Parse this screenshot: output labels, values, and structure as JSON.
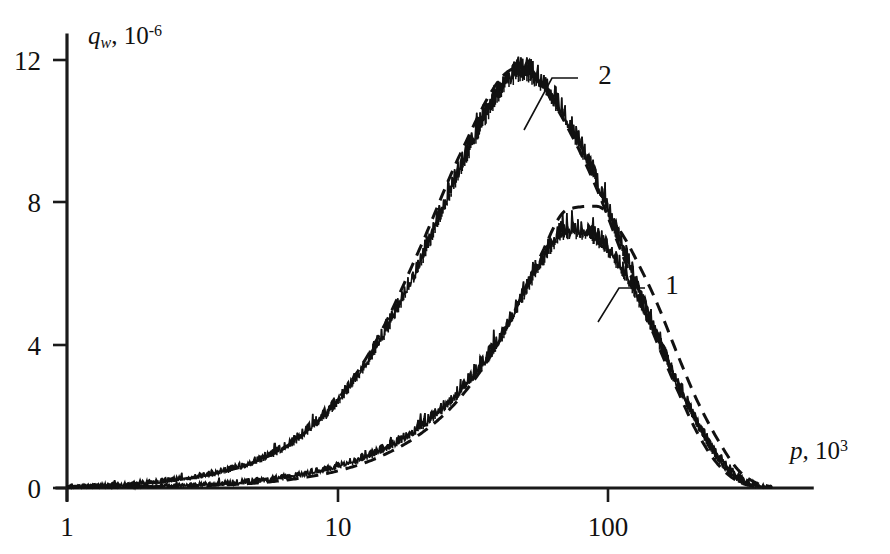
{
  "chart_data": {
    "type": "line",
    "title": "",
    "xlabel": "p, 10^3",
    "xlabel_base": "p,",
    "xlabel_mantissa": "10",
    "xlabel_exp": "3",
    "ylabel": "q_w, 10^-6",
    "ylabel_sym": "q",
    "ylabel_sub": "w",
    "ylabel_comma": ",",
    "ylabel_mantissa": "10",
    "ylabel_exp": "-6",
    "xscale": "log",
    "yscale": "linear",
    "xlim": [
      1,
      400
    ],
    "ylim": [
      0,
      13.2
    ],
    "grid": false,
    "legend_position": "inline-annotations",
    "x_ticks": [
      {
        "value": 1,
        "label": "1",
        "px": 67
      },
      {
        "value": 10,
        "label": "10",
        "px": 338
      },
      {
        "value": 100,
        "label": "100",
        "px": 608
      }
    ],
    "y_ticks": [
      {
        "value": 0,
        "label": "0",
        "px": 488
      },
      {
        "value": 4,
        "label": "4",
        "px": 345
      },
      {
        "value": 8,
        "label": "8",
        "px": 202
      },
      {
        "value": 12,
        "label": "12",
        "px": 60
      }
    ],
    "annotations": [
      {
        "text": "2",
        "x_px": 605,
        "y_px": 75,
        "leader_from_x": 578,
        "leader_from_y": 78,
        "leader_to_x": 524,
        "leader_to_y": 130
      },
      {
        "text": "1",
        "x_px": 672,
        "y_px": 285,
        "leader_from_x": 645,
        "leader_from_y": 288,
        "leader_to_x": 598,
        "leader_to_y": 322
      }
    ],
    "series": [
      {
        "name": "1",
        "style": "experiment-noisy-solid",
        "comment": "lower curve, measured spectrum with high-frequency noise",
        "x": [
          1,
          1.5,
          2.2,
          3.3,
          5,
          7,
          10,
          14,
          20,
          28,
          40,
          55,
          70,
          90,
          110,
          130,
          150,
          180,
          210,
          250,
          300,
          350,
          400
        ],
        "y": [
          0.02,
          0.04,
          0.07,
          0.12,
          0.22,
          0.38,
          0.65,
          1.05,
          1.75,
          2.75,
          4.3,
          6.3,
          7.3,
          7.1,
          6.3,
          5.3,
          4.3,
          2.9,
          1.9,
          1.0,
          0.35,
          0.1,
          0.02
        ]
      },
      {
        "name": "1-theory",
        "style": "theory-dashed",
        "comment": "lower curve, calculated spectrum",
        "x": [
          1,
          1.5,
          2.2,
          3.3,
          5,
          7,
          10,
          14,
          20,
          28,
          40,
          55,
          70,
          90,
          110,
          130,
          150,
          180,
          210,
          250,
          300,
          350,
          400
        ],
        "y": [
          0.01,
          0.02,
          0.04,
          0.07,
          0.14,
          0.26,
          0.48,
          0.85,
          1.5,
          2.5,
          4.2,
          6.4,
          7.8,
          7.9,
          7.2,
          6.2,
          5.2,
          3.7,
          2.5,
          1.4,
          0.5,
          0.14,
          0.03
        ]
      },
      {
        "name": "2",
        "style": "experiment-noisy-solid",
        "comment": "upper curve, measured spectrum with high-frequency noise",
        "x": [
          1,
          1.5,
          2.2,
          3.3,
          5,
          7,
          10,
          14,
          20,
          28,
          40,
          48,
          60,
          75,
          90,
          110,
          130,
          150,
          180,
          210,
          250,
          300,
          350,
          400
        ],
        "y": [
          0.05,
          0.1,
          0.2,
          0.4,
          0.8,
          1.4,
          2.5,
          4.1,
          6.4,
          9.0,
          11.3,
          11.8,
          11.2,
          10.0,
          8.7,
          7.0,
          5.6,
          4.4,
          3.0,
          1.9,
          0.9,
          0.25,
          0.06,
          0.01
        ]
      },
      {
        "name": "2-theory",
        "style": "theory-dashed",
        "comment": "upper curve, calculated spectrum",
        "x": [
          1,
          1.5,
          2.2,
          3.3,
          5,
          7,
          10,
          14,
          20,
          28,
          40,
          48,
          60,
          75,
          90,
          110,
          130,
          150,
          180,
          210,
          250,
          300,
          350,
          400
        ],
        "y": [
          0.04,
          0.09,
          0.18,
          0.36,
          0.75,
          1.35,
          2.5,
          4.2,
          6.7,
          9.3,
          11.5,
          11.8,
          11.0,
          9.7,
          8.4,
          6.7,
          5.3,
          4.1,
          2.7,
          1.6,
          0.7,
          0.18,
          0.04,
          0.01
        ]
      }
    ]
  },
  "axes": {
    "x_axis_name": "pressure-axis",
    "y_axis_name": "heat-flux-axis"
  }
}
